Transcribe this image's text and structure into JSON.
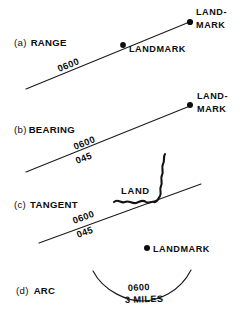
{
  "figure": {
    "background_color": "#ffffff",
    "ink_color": "#0d0d0d",
    "width": 244,
    "height": 312
  },
  "sections": [
    {
      "key": "range",
      "paren": "(a)",
      "label": "RANGE",
      "bearing_labels": [
        "0600"
      ],
      "landmarks": [
        {
          "line1": "LAND-",
          "line2": "MARK"
        },
        {
          "line1": "LANDMARK",
          "line2": ""
        }
      ]
    },
    {
      "key": "bearing",
      "paren": "(b)",
      "label": "BEARING",
      "bearing_labels": [
        "0600",
        "045"
      ],
      "landmarks": [
        {
          "line1": "LAND-",
          "line2": "MARK"
        }
      ]
    },
    {
      "key": "tangent",
      "paren": "(c)",
      "label": "TANGENT",
      "bearing_labels": [
        "0600",
        "045"
      ],
      "land_label": "LAND",
      "landmarks": []
    },
    {
      "key": "arc",
      "paren": "(d)",
      "label": "ARC",
      "bearing_labels": [
        "0600",
        "3 MILES"
      ],
      "landmarks": [
        {
          "line1": "LANDMARK",
          "line2": ""
        }
      ]
    }
  ],
  "text": {
    "a_paren": "(a)",
    "a_label": "RANGE",
    "a_time": "0600",
    "a_landmark1_line1": "LAND-",
    "a_landmark1_line2": "MARK",
    "a_landmark2": "LANDMARK",
    "b_paren": "(b)",
    "b_label": "BEARING",
    "b_time": "0600",
    "b_bearing": "045",
    "b_landmark_line1": "LAND-",
    "b_landmark_line2": "MARK",
    "c_paren": "(c)",
    "c_label": "TANGENT",
    "c_time": "0600",
    "c_bearing": "045",
    "c_land": "LAND",
    "d_paren": "(d)",
    "d_label": "ARC",
    "d_time": "0600",
    "d_distance": "3 MILES",
    "d_landmark": "LANDMARK"
  }
}
